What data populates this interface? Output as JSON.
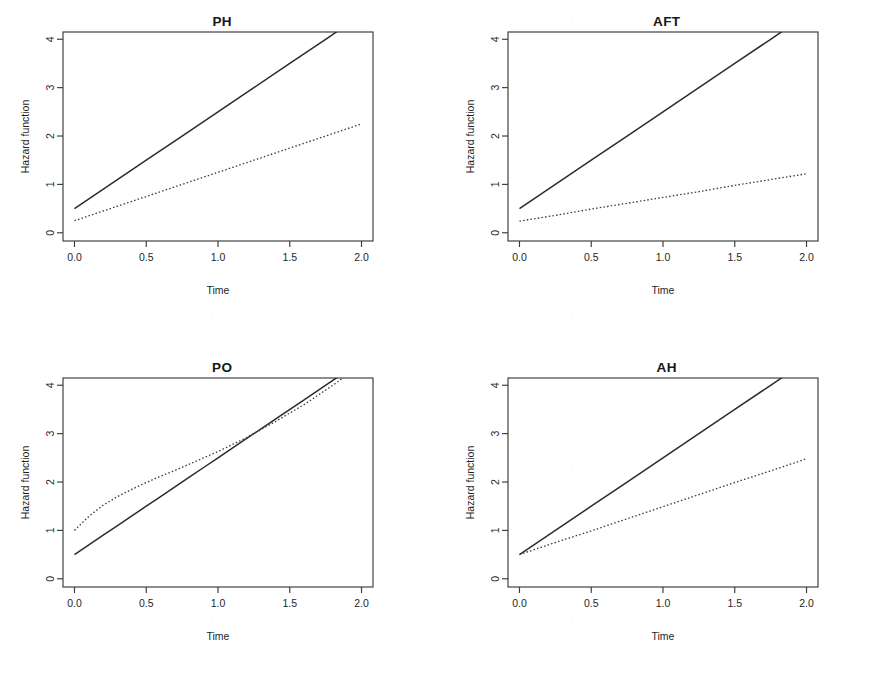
{
  "figure": {
    "panel_order": [
      "ph",
      "aft",
      "po",
      "ah"
    ],
    "axis": {
      "xlabel": "Time",
      "ylabel": "Hazard function",
      "xticks": [
        "0.0",
        "0.5",
        "1.0",
        "1.5",
        "2.0"
      ],
      "yticks": [
        "0",
        "1",
        "2",
        "3",
        "4"
      ]
    },
    "colors": {
      "baseline_curve": "#2b2b2b",
      "covariate_curve": "#3d3d3d",
      "axis": "#3a3a3a",
      "background": "#ffffff"
    }
  },
  "chart_data": [
    {
      "type": "line",
      "title": "PH",
      "xlabel": "Time",
      "ylabel": "Hazard function",
      "xlim": [
        -0.08,
        2.08
      ],
      "ylim": [
        -0.17,
        4.15
      ],
      "xticks": [
        0.0,
        0.5,
        1.0,
        1.5,
        2.0
      ],
      "yticks": [
        0,
        1,
        2,
        3,
        4
      ],
      "grid": false,
      "legend": "none",
      "x": [
        0.0,
        0.25,
        0.5,
        0.75,
        1.0,
        1.25,
        1.5,
        1.75,
        2.0
      ],
      "series": [
        {
          "name": "baseline",
          "style": "solid",
          "clipped_at_top": true,
          "values": [
            0.5,
            1.0,
            1.5,
            2.0,
            2.5,
            3.0,
            3.5,
            4.0,
            4.5
          ]
        },
        {
          "name": "covariate",
          "style": "dotted",
          "clipped_at_top": false,
          "values": [
            0.25,
            0.5,
            0.75,
            1.0,
            1.25,
            1.5,
            1.75,
            2.0,
            2.25
          ]
        }
      ]
    },
    {
      "type": "line",
      "title": "AFT",
      "xlabel": "Time",
      "ylabel": "Hazard function",
      "xlim": [
        -0.08,
        2.08
      ],
      "ylim": [
        -0.17,
        4.15
      ],
      "xticks": [
        0.0,
        0.5,
        1.0,
        1.5,
        2.0
      ],
      "yticks": [
        0,
        1,
        2,
        3,
        4
      ],
      "grid": false,
      "legend": "none",
      "x": [
        0.0,
        0.25,
        0.5,
        0.75,
        1.0,
        1.25,
        1.5,
        1.75,
        2.0
      ],
      "series": [
        {
          "name": "baseline",
          "style": "solid",
          "clipped_at_top": true,
          "values": [
            0.5,
            1.0,
            1.5,
            2.0,
            2.5,
            3.0,
            3.5,
            4.0,
            4.5
          ]
        },
        {
          "name": "covariate",
          "style": "dotted",
          "clipped_at_top": false,
          "values": [
            0.24,
            0.36,
            0.49,
            0.61,
            0.73,
            0.85,
            0.98,
            1.1,
            1.22
          ]
        }
      ]
    },
    {
      "type": "line",
      "title": "PO",
      "xlabel": "Time",
      "ylabel": "Hazard function",
      "xlim": [
        -0.08,
        2.08
      ],
      "ylim": [
        -0.17,
        4.15
      ],
      "xticks": [
        0.0,
        0.5,
        1.0,
        1.5,
        2.0
      ],
      "yticks": [
        0,
        1,
        2,
        3,
        4
      ],
      "grid": false,
      "legend": "none",
      "x": [
        0.0,
        0.1,
        0.2,
        0.3,
        0.4,
        0.5,
        0.6,
        0.7,
        0.8,
        0.9,
        1.0,
        1.2,
        1.4,
        1.6,
        1.8,
        2.0
      ],
      "series": [
        {
          "name": "baseline",
          "style": "solid",
          "clipped_at_top": true,
          "values": [
            0.5,
            0.7,
            0.9,
            1.1,
            1.3,
            1.5,
            1.7,
            1.9,
            2.1,
            2.3,
            2.5,
            2.9,
            3.3,
            3.7,
            4.1,
            4.5
          ]
        },
        {
          "name": "covariate",
          "style": "dotted",
          "clipped_at_top": true,
          "values": [
            1.0,
            1.29,
            1.52,
            1.7,
            1.85,
            1.99,
            2.12,
            2.24,
            2.37,
            2.5,
            2.63,
            2.92,
            3.25,
            3.6,
            4.0,
            4.42
          ]
        }
      ]
    },
    {
      "type": "line",
      "title": "AH",
      "xlabel": "Time",
      "ylabel": "Hazard function",
      "xlim": [
        -0.08,
        2.08
      ],
      "ylim": [
        -0.17,
        4.15
      ],
      "xticks": [
        0.0,
        0.5,
        1.0,
        1.5,
        2.0
      ],
      "yticks": [
        0,
        1,
        2,
        3,
        4
      ],
      "grid": false,
      "legend": "none",
      "x": [
        0.0,
        0.25,
        0.5,
        0.75,
        1.0,
        1.25,
        1.5,
        1.75,
        2.0
      ],
      "series": [
        {
          "name": "baseline",
          "style": "solid",
          "clipped_at_top": true,
          "values": [
            0.5,
            1.0,
            1.5,
            2.0,
            2.5,
            3.0,
            3.5,
            4.0,
            4.5
          ]
        },
        {
          "name": "covariate",
          "style": "dotted",
          "clipped_at_top": false,
          "values": [
            0.5,
            0.75,
            0.99,
            1.24,
            1.49,
            1.74,
            1.99,
            2.23,
            2.48
          ]
        }
      ]
    }
  ]
}
